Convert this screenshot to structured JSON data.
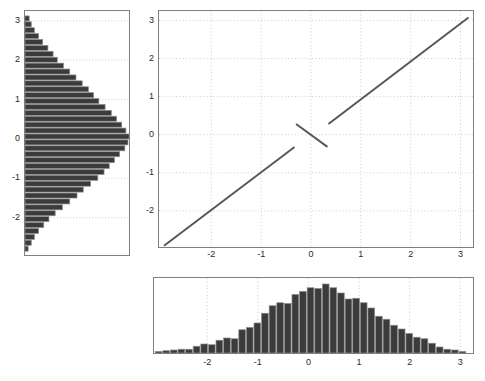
{
  "figure": {
    "width": 485,
    "height": 381,
    "background": "#ffffff",
    "axis_color": "#808080",
    "grid_color": "#bfbfbf",
    "bar_fill": "#3b3b3b",
    "bar_edge": "#8a8a8a",
    "line_color": "#555555",
    "tick_text_color": "#2a2a2a"
  },
  "chart_data": [
    {
      "id": "left-marginal-histogram",
      "type": "bar",
      "orientation": "horizontal",
      "title": "",
      "xlabel": "",
      "ylabel": "",
      "xlim": [
        0,
        1
      ],
      "ylim": [
        -2.95,
        3.25
      ],
      "grid": true,
      "ytick_labels": [
        "3",
        "2",
        "1",
        "0",
        "-1",
        "-2"
      ],
      "ytick_values": [
        3,
        2,
        1,
        0,
        -1,
        -2
      ],
      "xtick_labels": [],
      "bin_centers": [
        3.05,
        2.9,
        2.75,
        2.6,
        2.45,
        2.3,
        2.15,
        2.0,
        1.85,
        1.7,
        1.55,
        1.4,
        1.25,
        1.1,
        0.95,
        0.8,
        0.65,
        0.5,
        0.35,
        0.2,
        0.05,
        -0.1,
        -0.25,
        -0.4,
        -0.55,
        -0.7,
        -0.85,
        -1.0,
        -1.15,
        -1.3,
        -1.45,
        -1.6,
        -1.75,
        -1.9,
        -2.05,
        -2.2,
        -2.35,
        -2.5,
        -2.65,
        -2.8
      ],
      "values": [
        0.04,
        0.06,
        0.09,
        0.13,
        0.17,
        0.22,
        0.27,
        0.31,
        0.37,
        0.43,
        0.49,
        0.55,
        0.61,
        0.66,
        0.71,
        0.77,
        0.83,
        0.88,
        0.93,
        0.97,
        1.0,
        0.99,
        0.96,
        0.91,
        0.86,
        0.81,
        0.76,
        0.7,
        0.63,
        0.56,
        0.5,
        0.43,
        0.36,
        0.29,
        0.23,
        0.18,
        0.13,
        0.09,
        0.06,
        0.03
      ]
    },
    {
      "id": "main-scatter-plot",
      "type": "line",
      "title": "",
      "xlabel": "",
      "ylabel": "",
      "xlim": [
        -3.05,
        3.25
      ],
      "ylim": [
        -2.95,
        3.25
      ],
      "grid": true,
      "xtick_labels": [
        "-2",
        "-1",
        "0",
        "1",
        "2",
        "3"
      ],
      "xtick_values": [
        -2,
        -1,
        0,
        1,
        2,
        3
      ],
      "ytick_labels": [
        "3",
        "2",
        "1",
        "0",
        "-1",
        "-2"
      ],
      "ytick_values": [
        3,
        2,
        1,
        0,
        -1,
        -2
      ],
      "series": [
        {
          "name": "lower-branch",
          "x": [
            -2.95,
            -0.33
          ],
          "y": [
            -2.92,
            -0.32
          ]
        },
        {
          "name": "center-branch",
          "x": [
            -0.3,
            0.33
          ],
          "y": [
            0.28,
            -0.32
          ]
        },
        {
          "name": "upper-branch",
          "x": [
            0.35,
            3.16
          ],
          "y": [
            0.28,
            3.08
          ]
        }
      ]
    },
    {
      "id": "bottom-marginal-histogram",
      "type": "bar",
      "orientation": "vertical",
      "title": "",
      "xlabel": "",
      "ylabel": "",
      "xlim": [
        -3.05,
        3.25
      ],
      "ylim": [
        0,
        1
      ],
      "grid": true,
      "xtick_labels": [
        "-2",
        "-1",
        "0",
        "1",
        "2",
        "3"
      ],
      "xtick_values": [
        -2,
        -1,
        0,
        1,
        2,
        3
      ],
      "ytick_labels": [],
      "bin_centers": [
        -2.95,
        -2.8,
        -2.65,
        -2.5,
        -2.35,
        -2.2,
        -2.05,
        -1.9,
        -1.75,
        -1.6,
        -1.45,
        -1.3,
        -1.15,
        -1.0,
        -0.85,
        -0.7,
        -0.55,
        -0.4,
        -0.25,
        -0.1,
        0.05,
        0.2,
        0.35,
        0.5,
        0.65,
        0.8,
        0.95,
        1.1,
        1.25,
        1.4,
        1.55,
        1.7,
        1.85,
        2.0,
        2.15,
        2.3,
        2.45,
        2.6,
        2.75,
        2.9,
        3.05
      ],
      "values": [
        0.02,
        0.03,
        0.04,
        0.05,
        0.05,
        0.09,
        0.12,
        0.11,
        0.17,
        0.2,
        0.19,
        0.31,
        0.34,
        0.4,
        0.53,
        0.63,
        0.67,
        0.66,
        0.78,
        0.82,
        0.87,
        0.86,
        0.92,
        0.87,
        0.8,
        0.72,
        0.73,
        0.67,
        0.6,
        0.49,
        0.45,
        0.37,
        0.32,
        0.26,
        0.21,
        0.19,
        0.13,
        0.08,
        0.05,
        0.04,
        0.02
      ]
    }
  ]
}
